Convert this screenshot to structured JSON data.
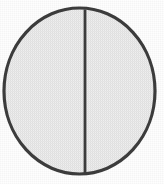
{
  "figure": {
    "kind": "line-drawing",
    "caption": "",
    "background_color": "#fefefe",
    "stroke_color": "#3d3d3d",
    "fill_color": "#ececec",
    "canvas": {
      "width": 164,
      "height": 184
    },
    "shapes": {
      "circle": {
        "name": "outer-circle",
        "center_x": 79.5,
        "center_y": 91,
        "radius_x": 75.5,
        "radius_y": 83,
        "stroke_width": 3.2
      },
      "divider": {
        "name": "vertical-diameter-line",
        "x": 85,
        "y_top": 9.5,
        "y_bottom": 173,
        "stroke_width": 2.8
      }
    }
  },
  "labels": {
    "figure_title": "",
    "axis_note": ""
  }
}
